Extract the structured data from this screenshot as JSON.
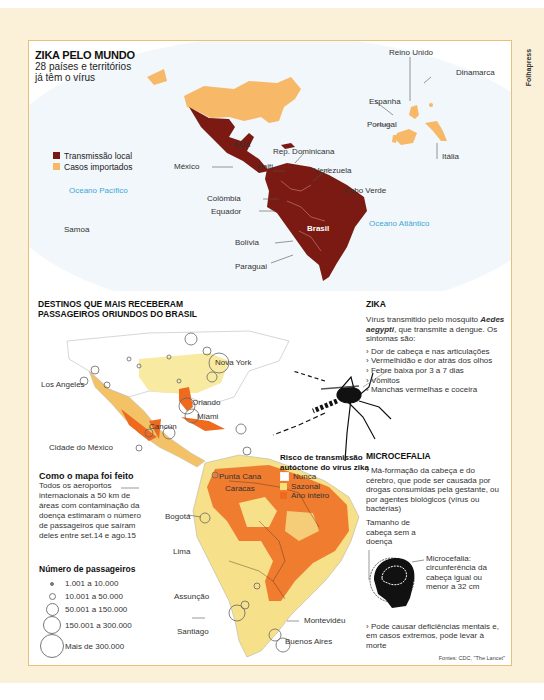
{
  "credit": "Folhapress",
  "world_map": {
    "title": "ZIKA PELO MUNDO",
    "subtitle_line1": "28 países e territórios",
    "subtitle_line2": "já têm o vírus",
    "legend": [
      {
        "label": "Transmissão local",
        "color": "#7a1a12"
      },
      {
        "label": "Casos importados",
        "color": "#f7b867"
      }
    ],
    "oceans": {
      "pacific": "Oceano Pacífico",
      "atlantic": "Oceano Atlântico"
    },
    "country_labels": {
      "eua": "EUA",
      "mexico": "México",
      "haiti": "Haiti",
      "rep_dominicana": "Rep. Dominicana",
      "venezuela": "Venezuela",
      "colombia": "Colômbia",
      "equador": "Equador",
      "bolivia": "Bolívia",
      "paraguai": "Paraguai",
      "brasil": "Brasil",
      "samoa": "Samoa",
      "cabo_verde": "Cabo Verde",
      "reino_unido": "Reino Unido",
      "dinamarca": "Dinamarca",
      "espanha": "Espanha",
      "portugal": "Portugal",
      "italia": "Itália"
    }
  },
  "destinations_map": {
    "title_line1": "DESTINOS QUE MAIS RECEBERAM",
    "title_line2": "PASSAGEIROS ORIUNDOS DO BRASIL",
    "cities": {
      "nova_york": "Nova York",
      "los_angeles": "Los Angeles",
      "orlando": "Orlando",
      "miami": "Miami",
      "cancun": "Cancún",
      "cidade_do_mexico": "Cidade do México",
      "punta_cana": "Punta Cana",
      "caracas": "Caracas",
      "bogota": "Bogotá",
      "lima": "Lima",
      "assuncao": "Assunção",
      "santiago": "Santiago",
      "montevideu": "Montevidéu",
      "buenos_aires": "Buenos Aires"
    },
    "risk_legend": {
      "title_line1": "Risco de transmissão",
      "title_line2": "autóctone do vírus zika",
      "items": [
        {
          "label": "Nunca",
          "color": "#ffffff"
        },
        {
          "label": "Sazonal",
          "color": "#f7e27a"
        },
        {
          "label": "Ano inteiro",
          "color": "#ee6a1e"
        }
      ]
    },
    "how_made": {
      "title": "Como o mapa foi feito",
      "text": "Todos os aeroportos internacionais a 50 km de áreas com contaminação da doença estimaram o número de passageiros que saíram deles entre set.14 e ago.15"
    },
    "passengers_legend": {
      "title": "Número de passageiros",
      "items": [
        {
          "label": "1.001 a 10.000",
          "size": 2
        },
        {
          "label": "10.001 a 50.000",
          "size": 5
        },
        {
          "label": "50.001 a 150.000",
          "size": 11
        },
        {
          "label": "150.001 a 300.000",
          "size": 17
        },
        {
          "label": "Mais de 300.000",
          "size": 24
        }
      ]
    }
  },
  "zika_box": {
    "title": "ZIKA",
    "intro_pre": "Vírus transmitido pelo mosquito ",
    "intro_species": "Aedes aegypti",
    "intro_post": ", que transmite a dengue. Os sintomas são:",
    "symptoms": [
      "› Dor de cabeça e nas articulações",
      "› Vermelhidão e dor atrás dos olhos",
      "› Febre baixa por 3 a 7 dias",
      "› Vômitos",
      "› Manchas vermelhas e coceira"
    ]
  },
  "microcefalia_box": {
    "title": "MICROCEFALIA",
    "text1": "› Má-formação da cabeça e do cérebro, que pode ser causada por drogas consumidas pela gestante, ou por agentes biológicos (vírus ou bactérias)",
    "head_label_normal": "Tamanho de cabeça sem a doença",
    "head_label_micro": "Microcefalia: circunferência da cabeça igual ou menor a 32 cm",
    "text2": "› Pode causar deficiências mentais e, em casos extremos, pode levar à morte"
  },
  "sources": "Fontes: CDC, \"The Lancet\""
}
